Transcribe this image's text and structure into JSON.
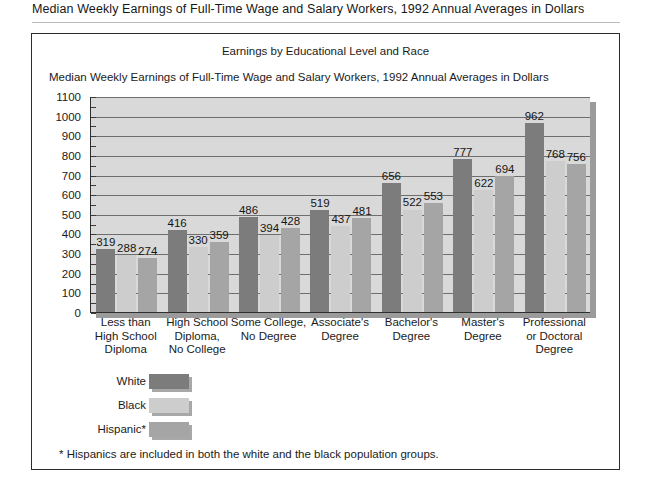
{
  "page_header": {
    "title": "Median Weekly Earnings of Full-Time Wage and Salary Workers, 1992 Annual Averages in Dollars"
  },
  "figure": {
    "title": "Earnings by Educational Level and Race",
    "subtitle": "Median Weekly Earnings of Full-Time Wage and Salary Workers, 1992 Annual Averages in Dollars",
    "footnote": "* Hispanics are included in both the white and the black population groups."
  },
  "legend": {
    "items": [
      {
        "label": "White",
        "color": "#7c7c7c"
      },
      {
        "label": "Black",
        "color": "#cdcdcd"
      },
      {
        "label": "Hispanic*",
        "color": "#a5a5a5"
      }
    ]
  },
  "chart_data": {
    "type": "bar",
    "title": "Earnings by Educational Level and Race",
    "subtitle": "Median Weekly Earnings of Full-Time Wage and Salary Workers, 1992 Annual Averages in Dollars",
    "xlabel": "",
    "ylabel": "",
    "ylim": [
      0,
      1100
    ],
    "ytick_step": 100,
    "yticks": [
      1100,
      1000,
      900,
      800,
      700,
      600,
      500,
      400,
      300,
      200,
      100,
      0
    ],
    "grid": true,
    "legend_position": "below-left",
    "categories": [
      "Less than\nHigh School\nDiploma",
      "High School\nDiploma,\nNo College",
      "Some College,\nNo Degree",
      "Associate's\nDegree",
      "Bachelor's\nDegree",
      "Master's\nDegree",
      "Professional\nor Doctoral\nDegree"
    ],
    "category_labels": [
      [
        "Less than",
        "High School",
        "Diploma"
      ],
      [
        "High School",
        "Diploma,",
        "No College"
      ],
      [
        "Some College,",
        "No Degree"
      ],
      [
        "Associate's",
        "Degree"
      ],
      [
        "Bachelor's",
        "Degree"
      ],
      [
        "Master's",
        "Degree"
      ],
      [
        "Professional",
        "or Doctoral",
        "Degree"
      ]
    ],
    "series": [
      {
        "name": "White",
        "color": "#7c7c7c",
        "values": [
          319,
          416,
          486,
          519,
          656,
          777,
          962
        ]
      },
      {
        "name": "Black",
        "color": "#cdcdcd",
        "values": [
          288,
          330,
          394,
          437,
          522,
          622,
          768
        ]
      },
      {
        "name": "Hispanic*",
        "color": "#a5a5a5",
        "values": [
          274,
          359,
          428,
          481,
          553,
          694,
          756
        ]
      }
    ],
    "annotation": "* Hispanics are included in both the white and the black population groups."
  }
}
